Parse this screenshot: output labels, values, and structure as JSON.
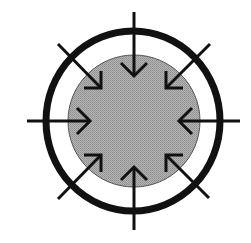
{
  "diagram": {
    "title": "",
    "description": "Inward compression diagram: shaded inner circle inside a thick outer ring, with eight arrows pointing inward from all directions",
    "colors": {
      "background": "#ffffff",
      "stroke": "#111111",
      "inner_fill": "#a6a6a6",
      "inner_outline": "#555555"
    },
    "outer_ring": {
      "cx": 133,
      "cy": 121,
      "rx": 87,
      "ry": 90,
      "stroke_width": 7
    },
    "inner_circle": {
      "cx": 134,
      "cy": 121,
      "r": 66
    },
    "arrows": [
      {
        "name": "arrow-top",
        "direction": "down",
        "x1": 134,
        "y1": 12,
        "x2": 134,
        "y2": 76,
        "head": "134,76 121,63 | 134,76 147,63"
      },
      {
        "name": "arrow-bottom",
        "direction": "up",
        "x1": 134,
        "y1": 230,
        "x2": 134,
        "y2": 167,
        "head": "134,167 121,180 | 134,167 147,180"
      },
      {
        "name": "arrow-left",
        "direction": "right",
        "x1": 27,
        "y1": 121,
        "x2": 90,
        "y2": 121,
        "head": "90,121 77,108 | 90,121 77,134"
      },
      {
        "name": "arrow-right",
        "direction": "left",
        "x1": 240,
        "y1": 121,
        "x2": 179,
        "y2": 121,
        "head": "179,121 192,108 | 179,121 192,134"
      },
      {
        "name": "arrow-top-left",
        "direction": "down-right",
        "x1": 58,
        "y1": 44,
        "x2": 101,
        "y2": 88,
        "head": "101,88 101,71 | 101,88 84,88"
      },
      {
        "name": "arrow-top-right",
        "direction": "down-left",
        "x1": 210,
        "y1": 44,
        "x2": 166,
        "y2": 88,
        "head": "166,88 166,71 | 166,88 183,88"
      },
      {
        "name": "arrow-bottom-left",
        "direction": "up-right",
        "x1": 58,
        "y1": 199,
        "x2": 101,
        "y2": 155,
        "head": "101,155 101,172 | 101,155 84,155"
      },
      {
        "name": "arrow-bottom-right",
        "direction": "up-left",
        "x1": 209,
        "y1": 198,
        "x2": 166,
        "y2": 155,
        "head": "166,155 166,172 | 166,155 183,155"
      }
    ]
  }
}
